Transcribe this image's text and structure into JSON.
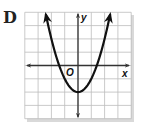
{
  "choice": {
    "label": "D"
  },
  "graph": {
    "x_axis_label": "x",
    "y_axis_label": "y",
    "origin_label": "O",
    "grid": {
      "x_min": -4,
      "x_max": 4,
      "y_min": -4,
      "y_max": 4,
      "step": 1
    },
    "curve": {
      "type": "parabola",
      "equation": "y = x^2 - 2",
      "a": 1,
      "h": 0,
      "k": -2,
      "opens": "up"
    },
    "colors": {
      "grid": "#bdbdbd",
      "axis": "#333333",
      "curve": "#111111",
      "shadow": "#d6d6d6"
    }
  },
  "chart_data": {
    "type": "line",
    "title": "",
    "xlabel": "x",
    "ylabel": "y",
    "xlim": [
      -4,
      4
    ],
    "ylim": [
      -4,
      4
    ],
    "grid": true,
    "series": [
      {
        "name": "y = x^2 - 2",
        "x": [
          -2.45,
          -2,
          -1.5,
          -1,
          -0.5,
          0,
          0.5,
          1,
          1.5,
          2,
          2.45
        ],
        "y": [
          4.0,
          2,
          0.25,
          -1,
          -1.75,
          -2,
          -1.75,
          -1,
          0.25,
          2,
          4.0
        ]
      }
    ],
    "annotations": [
      "O (origin)",
      "vertex (0, -2)",
      "arrows at both ends of curve"
    ]
  }
}
